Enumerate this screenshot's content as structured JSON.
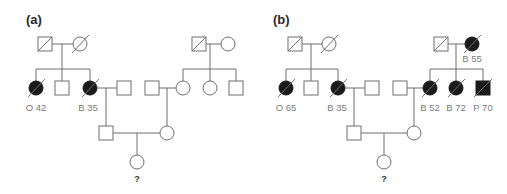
{
  "figure": {
    "type": "pedigree",
    "colors": {
      "affected": "#1a1a1a",
      "unaffected": "#ffffff",
      "line": "#6f6f6f",
      "label": "#7a7a7a"
    },
    "panels": [
      {
        "id": "a",
        "label": "(a)",
        "individuals": [
          {
            "id": "a-I1",
            "sex": "male",
            "affected": false,
            "deceased": true,
            "label": ""
          },
          {
            "id": "a-I2",
            "sex": "female",
            "affected": false,
            "deceased": true,
            "label": ""
          },
          {
            "id": "a-II1",
            "sex": "female",
            "affected": true,
            "deceased": true,
            "label": "O 42"
          },
          {
            "id": "a-II2",
            "sex": "male",
            "affected": false,
            "deceased": false,
            "label": ""
          },
          {
            "id": "a-II3",
            "sex": "female",
            "affected": true,
            "deceased": true,
            "label": "B 35"
          },
          {
            "id": "a-II4",
            "sex": "male",
            "affected": false,
            "deceased": false,
            "label": ""
          },
          {
            "id": "a-I3",
            "sex": "male",
            "affected": false,
            "deceased": true,
            "label": ""
          },
          {
            "id": "a-I4",
            "sex": "female",
            "affected": false,
            "deceased": false,
            "label": ""
          },
          {
            "id": "a-II5",
            "sex": "male",
            "affected": false,
            "deceased": false,
            "label": ""
          },
          {
            "id": "a-II6",
            "sex": "female",
            "affected": false,
            "deceased": false,
            "label": ""
          },
          {
            "id": "a-II7",
            "sex": "female",
            "affected": false,
            "deceased": false,
            "label": ""
          },
          {
            "id": "a-II8",
            "sex": "male",
            "affected": false,
            "deceased": false,
            "label": ""
          },
          {
            "id": "a-III1",
            "sex": "male",
            "affected": false,
            "deceased": false,
            "label": ""
          },
          {
            "id": "a-III2",
            "sex": "female",
            "affected": false,
            "deceased": false,
            "label": ""
          },
          {
            "id": "a-IV1",
            "sex": "female",
            "affected": false,
            "deceased": false,
            "label": "?"
          }
        ]
      },
      {
        "id": "b",
        "label": "(b)",
        "individuals": [
          {
            "id": "b-I1",
            "sex": "male",
            "affected": false,
            "deceased": true,
            "label": ""
          },
          {
            "id": "b-I2",
            "sex": "female",
            "affected": false,
            "deceased": true,
            "label": ""
          },
          {
            "id": "b-II1",
            "sex": "female",
            "affected": true,
            "deceased": true,
            "label": "O 65"
          },
          {
            "id": "b-II2",
            "sex": "male",
            "affected": false,
            "deceased": false,
            "label": ""
          },
          {
            "id": "b-II3",
            "sex": "female",
            "affected": true,
            "deceased": true,
            "label": "B 35"
          },
          {
            "id": "b-II4",
            "sex": "male",
            "affected": false,
            "deceased": false,
            "label": ""
          },
          {
            "id": "b-I3",
            "sex": "male",
            "affected": false,
            "deceased": true,
            "label": ""
          },
          {
            "id": "b-I4",
            "sex": "female",
            "affected": true,
            "deceased": true,
            "label": "B 55"
          },
          {
            "id": "b-II5",
            "sex": "male",
            "affected": false,
            "deceased": false,
            "label": ""
          },
          {
            "id": "b-II6",
            "sex": "female",
            "affected": true,
            "deceased": true,
            "label": "B 52"
          },
          {
            "id": "b-II7",
            "sex": "female",
            "affected": true,
            "deceased": true,
            "label": "B 72"
          },
          {
            "id": "b-II8",
            "sex": "male",
            "affected": true,
            "deceased": true,
            "label": "P 70"
          },
          {
            "id": "b-III1",
            "sex": "male",
            "affected": false,
            "deceased": false,
            "label": ""
          },
          {
            "id": "b-III2",
            "sex": "female",
            "affected": false,
            "deceased": false,
            "label": ""
          },
          {
            "id": "b-IV1",
            "sex": "female",
            "affected": false,
            "deceased": false,
            "label": "?"
          }
        ]
      }
    ]
  },
  "labels": {
    "panel_a": "(a)",
    "panel_b": "(b)",
    "a_O42": "O 42",
    "a_B35": "B 35",
    "a_query": "?",
    "b_O65": "O 65",
    "b_B35": "B 35",
    "b_B55": "B 55",
    "b_B52": "B 52",
    "b_B72": "B 72",
    "b_P70": "P 70",
    "b_query": "?"
  }
}
